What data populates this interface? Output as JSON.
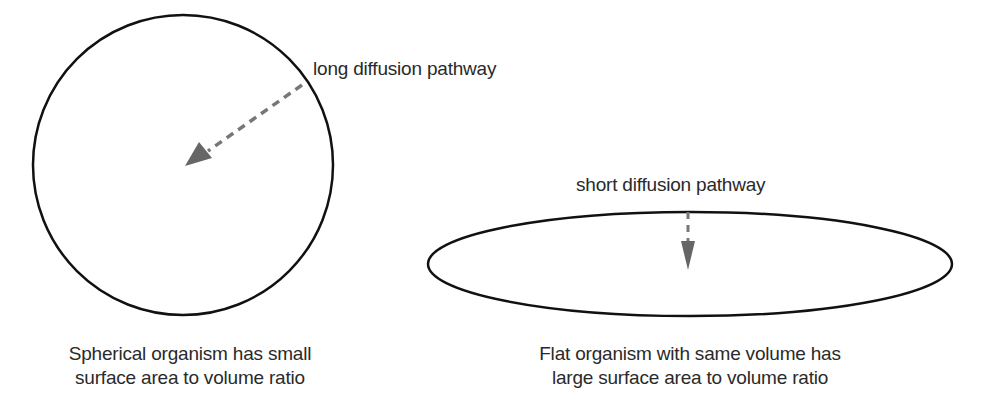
{
  "diagram": {
    "colors": {
      "outline": "#111111",
      "arrow": "#6e6e6e",
      "text": "#2a2a2a"
    },
    "sphere": {
      "label": "long diffusion pathway",
      "caption_line1": "Spherical organism has small",
      "caption_line2": "surface area to volume ratio"
    },
    "flat": {
      "label": "short diffusion pathway",
      "caption_line1": "Flat organism with same volume has",
      "caption_line2": "large surface area to volume ratio"
    }
  }
}
